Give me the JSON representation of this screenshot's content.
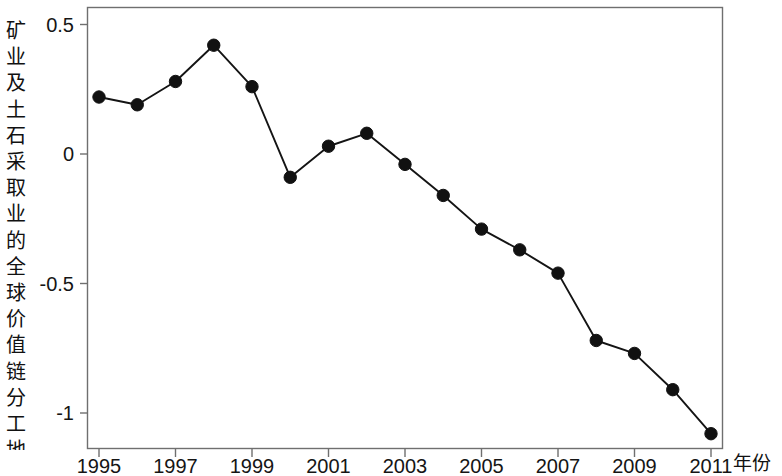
{
  "axes": {
    "y_axis_label": "矿业及土石采取业的全球价值链分工地位",
    "x_axis_label": "年份",
    "y_ticks": [
      "0.5",
      "0",
      "-0.5",
      "-1"
    ],
    "x_ticks": [
      "1995",
      "1997",
      "1999",
      "2001",
      "2003",
      "2005",
      "2007",
      "2009",
      "2011"
    ]
  },
  "style": {
    "line_color": "#141414",
    "marker_color": "#111111",
    "frame_color": "#6f6f6f",
    "background": "#ffffff"
  },
  "chart_data": {
    "type": "line",
    "title": "",
    "subtitle": "",
    "xlabel": "年份",
    "ylabel": "矿业及土石采取业的全球价值链分工地位",
    "x": [
      1995,
      1996,
      1997,
      1998,
      1999,
      2000,
      2001,
      2002,
      2003,
      2004,
      2005,
      2006,
      2007,
      2008,
      2009,
      2010,
      2011
    ],
    "values": [
      0.22,
      0.19,
      0.28,
      0.42,
      0.26,
      -0.09,
      0.03,
      0.08,
      -0.04,
      -0.16,
      -0.29,
      -0.37,
      -0.46,
      -0.72,
      -0.77,
      -0.91,
      -1.08
    ],
    "series": [
      {
        "name": "矿业及土石采取业的全球价值链分工地位",
        "values": [
          0.22,
          0.19,
          0.28,
          0.42,
          0.26,
          -0.09,
          0.03,
          0.08,
          -0.04,
          -0.16,
          -0.29,
          -0.37,
          -0.46,
          -0.72,
          -0.77,
          -0.91,
          -1.08
        ]
      }
    ],
    "xlim": [
      1994.7,
      2011.7
    ],
    "ylim": [
      -1.14,
      0.57
    ],
    "y_tick_values": [
      0.5,
      0,
      -0.5,
      -1
    ],
    "x_tick_values": [
      1995,
      1997,
      1999,
      2001,
      2003,
      2005,
      2007,
      2009,
      2011
    ],
    "grid": false,
    "legend": "none",
    "marker": "filled-circle",
    "annotations": []
  }
}
